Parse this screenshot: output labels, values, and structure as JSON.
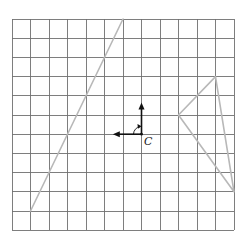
{
  "diagram": {
    "type": "grid-rotation-diagram",
    "grid": {
      "columns": 12,
      "rows": 11,
      "origin_px": [
        12,
        19
      ],
      "cell_w": 18.5,
      "cell_h": 19.2,
      "line_color": "#707070"
    },
    "figures": {
      "line_segment": {
        "color": "#b8b8b8",
        "points": [
          [
            1,
            10
          ],
          [
            6,
            0
          ]
        ]
      },
      "triangle": {
        "color": "#b8b8b8",
        "points": [
          [
            9,
            5
          ],
          [
            11,
            3
          ],
          [
            12,
            9
          ]
        ]
      }
    },
    "center": {
      "label": "C",
      "grid_point": [
        7,
        6
      ],
      "vector_up_to": [
        7,
        4.35
      ],
      "vector_left_to": [
        5.45,
        6
      ],
      "rotation": "clockwise 90°",
      "color": "#111111"
    }
  }
}
